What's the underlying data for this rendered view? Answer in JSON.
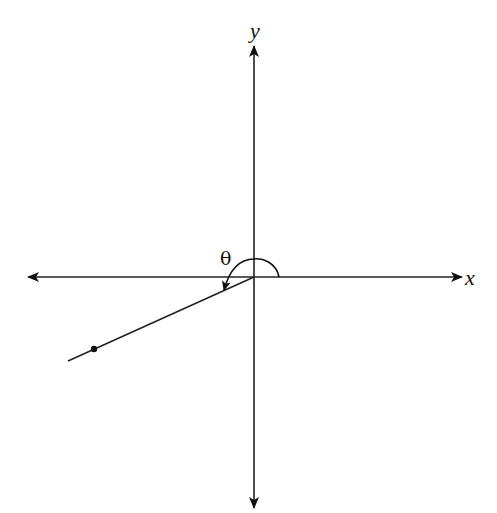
{
  "diagram": {
    "type": "angle-in-standard-position",
    "axes": {
      "x_label": "x",
      "y_label": "y",
      "origin": [
        254,
        277
      ],
      "x_range_px": [
        28,
        462
      ],
      "y_range_px": [
        46,
        508
      ]
    },
    "angle": {
      "label": "θ",
      "initial_side": "positive x-axis",
      "direction": "counterclockwise",
      "terminal_side_quadrant": "III"
    },
    "terminal_ray": {
      "start": [
        254,
        277
      ],
      "end": [
        68,
        361
      ],
      "point": [
        94,
        349
      ]
    },
    "colors": {
      "stroke": "#111111",
      "background": "#ffffff"
    }
  }
}
